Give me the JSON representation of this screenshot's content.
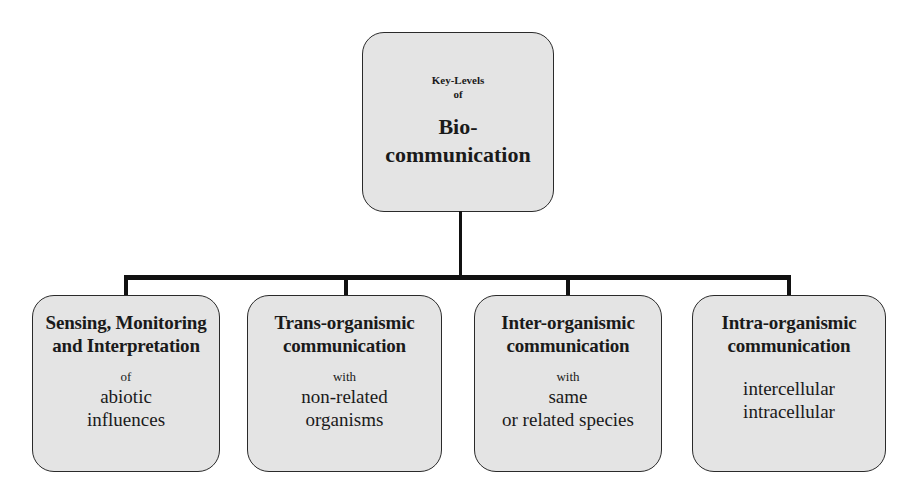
{
  "diagram": {
    "type": "hierarchy",
    "root": {
      "pre_line1": "Key-Levels",
      "pre_line2": "of",
      "title_line1": "Bio-",
      "title_line2": "communication"
    },
    "children": [
      {
        "title_line1": "Sensing, Monitoring",
        "title_line2": "and Interpretation",
        "connector": "of",
        "detail_line1": "abiotic",
        "detail_line2": "influences"
      },
      {
        "title_line1": "Trans-organismic",
        "title_line2": "communication",
        "connector": "with",
        "detail_line1": "non-related",
        "detail_line2": "organisms"
      },
      {
        "title_line1": "Inter-organismic",
        "title_line2": "communication",
        "connector": "with",
        "detail_line1": "same",
        "detail_line2": "or related species"
      },
      {
        "title_line1": "Intra-organismic",
        "title_line2": "communication",
        "connector": "",
        "detail_line1": "intercellular",
        "detail_line2": "intracellular"
      }
    ],
    "colors": {
      "box_fill": "#e4e4e4",
      "box_border": "#2a2a2a",
      "connector_line": "#111111",
      "background": "#ffffff"
    }
  }
}
